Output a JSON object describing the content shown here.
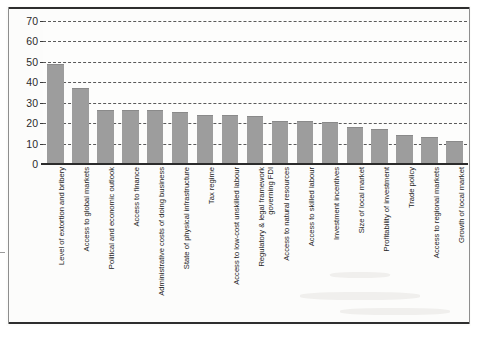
{
  "chart_data": {
    "type": "bar",
    "title": "",
    "subtitle": "",
    "xlabel": "",
    "ylabel": "",
    "ylim": [
      0,
      70
    ],
    "ytick_interval": 10,
    "yticks": [
      0,
      10,
      20,
      30,
      40,
      50,
      60,
      70
    ],
    "ytick_labels": [
      "0",
      "10",
      "20",
      "30",
      "40",
      "50",
      "60",
      "70"
    ],
    "grid": true,
    "grid_style": "dashed-horizontal",
    "legend": false,
    "legend_position": "none",
    "bar_color": "#9d9d9d",
    "categories": [
      "Level of extortion and bribery",
      "Access to global markets",
      "Political and economic outlook",
      "Access to finance",
      "Administrative costs of doing business",
      "State of physical infrastructure",
      "Tax regime",
      "Access to low-cost unskilled labour",
      "Regulatory & legal framework\ngoverning FDI",
      "Access to natural resources",
      "Access to skilled labour",
      "Investment incentives",
      "Size of local market",
      "Profitability of investment",
      "Trade policy",
      "Access to regional markets",
      "Growth of local market"
    ],
    "values": [
      49,
      37,
      26.5,
      26.5,
      26.5,
      25.5,
      24,
      24,
      23.5,
      21,
      21,
      20.5,
      18,
      17,
      14,
      13,
      11.5
    ]
  }
}
